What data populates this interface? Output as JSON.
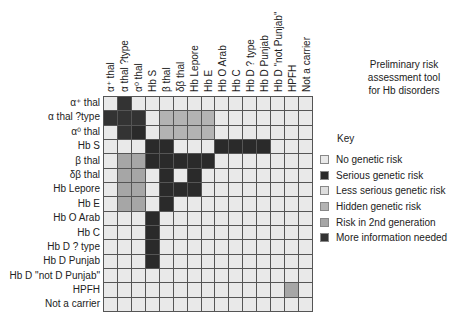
{
  "title": "Preliminary risk assessment tool for Hb disorders",
  "title_lines": [
    "Preliminary risk",
    "assessment tool",
    "for Hb disorders"
  ],
  "columns": [
    "α⁺ thal",
    "α thal ?type",
    "α⁰ thal",
    "Hb S",
    "β thal",
    "δβ thal",
    "Hb Lepore",
    "Hb E",
    "Hb O Arab",
    "Hb C",
    "Hb D ? type",
    "Hb D Punjab",
    "Hb D \"not Punjab\"",
    "HPFH",
    "Not a carrier"
  ],
  "rows": [
    "α⁺ thal",
    "α thal ?type",
    "α⁰ thal",
    "Hb S",
    "β thal",
    "δβ thal",
    "Hb Lepore",
    "Hb E",
    "Hb O Arab",
    "Hb C",
    "Hb D ? type",
    "Hb D Punjab",
    "Hb D \"not D Punjab\"",
    "HPFH",
    "Not a carrier"
  ],
  "key": {
    "title": "Key",
    "items": [
      {
        "id": "none",
        "label": "No genetic risk",
        "color": "#e9e9e9"
      },
      {
        "id": "serious",
        "label": "Serious genetic risk",
        "color": "#2a2a2a"
      },
      {
        "id": "less",
        "label": "Less serious genetic risk",
        "color": "#dedede"
      },
      {
        "id": "hidden",
        "label": "Hidden genetic risk",
        "color": "#b3b3b3"
      },
      {
        "id": "second",
        "label": "Risk in 2nd generation",
        "color": "#a6a6a6"
      },
      {
        "id": "more",
        "label": "More information needed",
        "color": "#333333"
      }
    ]
  },
  "matrix": [
    [
      "none",
      "more",
      "none",
      "none",
      "none",
      "none",
      "none",
      "none",
      "none",
      "none",
      "none",
      "none",
      "none",
      "none",
      "none"
    ],
    [
      "more",
      "more",
      "more",
      "none",
      "hidden",
      "hidden",
      "hidden",
      "hidden",
      "none",
      "none",
      "none",
      "none",
      "none",
      "none",
      "none"
    ],
    [
      "none",
      "more",
      "serious",
      "none",
      "hidden",
      "hidden",
      "hidden",
      "hidden",
      "none",
      "none",
      "none",
      "none",
      "none",
      "none",
      "none"
    ],
    [
      "none",
      "none",
      "none",
      "serious",
      "serious",
      "none",
      "none",
      "none",
      "serious",
      "serious",
      "serious",
      "serious",
      "none",
      "none",
      "none"
    ],
    [
      "none",
      "second",
      "second",
      "serious",
      "serious",
      "serious",
      "serious",
      "serious",
      "none",
      "none",
      "none",
      "none",
      "none",
      "none",
      "none"
    ],
    [
      "none",
      "second",
      "second",
      "none",
      "serious",
      "none",
      "serious",
      "none",
      "none",
      "none",
      "none",
      "none",
      "none",
      "none",
      "none"
    ],
    [
      "none",
      "second",
      "second",
      "none",
      "serious",
      "serious",
      "serious",
      "none",
      "none",
      "none",
      "none",
      "none",
      "none",
      "none",
      "none"
    ],
    [
      "none",
      "second",
      "second",
      "none",
      "serious",
      "none",
      "none",
      "none",
      "none",
      "none",
      "none",
      "none",
      "none",
      "none",
      "none"
    ],
    [
      "none",
      "none",
      "none",
      "serious",
      "none",
      "none",
      "none",
      "none",
      "none",
      "none",
      "none",
      "none",
      "none",
      "none",
      "none"
    ],
    [
      "none",
      "none",
      "none",
      "serious",
      "none",
      "none",
      "none",
      "none",
      "none",
      "none",
      "none",
      "none",
      "none",
      "none",
      "none"
    ],
    [
      "none",
      "none",
      "none",
      "serious",
      "none",
      "none",
      "none",
      "none",
      "none",
      "none",
      "none",
      "none",
      "none",
      "none",
      "none"
    ],
    [
      "none",
      "none",
      "none",
      "serious",
      "none",
      "none",
      "none",
      "none",
      "none",
      "none",
      "none",
      "none",
      "none",
      "none",
      "none"
    ],
    [
      "none",
      "none",
      "none",
      "none",
      "none",
      "none",
      "none",
      "none",
      "none",
      "none",
      "none",
      "none",
      "none",
      "none",
      "none"
    ],
    [
      "none",
      "none",
      "none",
      "none",
      "none",
      "none",
      "none",
      "none",
      "none",
      "none",
      "none",
      "none",
      "none",
      "second",
      "none"
    ],
    [
      "none",
      "none",
      "none",
      "none",
      "none",
      "none",
      "none",
      "none",
      "none",
      "none",
      "none",
      "none",
      "none",
      "none",
      "none"
    ]
  ]
}
